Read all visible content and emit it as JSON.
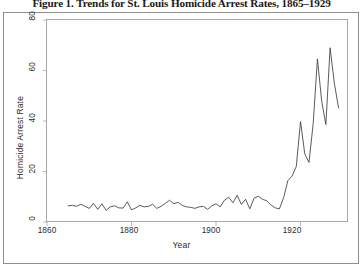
{
  "figure": {
    "title": "Figure 1. Trends for St. Louis Homicide Arrest Rates, 1865–1929"
  },
  "axes": {
    "y_label": "Homicide Arrest Rate",
    "x_label": "Year",
    "y_ticks": [
      "0",
      "20",
      "40",
      "60",
      "80"
    ],
    "x_ticks": [
      "1860",
      "1880",
      "1900",
      "1920"
    ]
  },
  "colors": {
    "line": "#3d3d3d",
    "axis": "#a8a8a8",
    "frame": "#8e8e8e",
    "text": "#2b2b2b",
    "background": "#ffffff"
  },
  "chart_data": {
    "type": "line",
    "title": "Figure 1. Trends for St. Louis Homicide Arrest Rates, 1865–1929",
    "xlabel": "Year",
    "ylabel": "Homicide Arrest Rate",
    "xlim": [
      1860,
      1931
    ],
    "ylim": [
      0,
      80
    ],
    "grid": false,
    "legend": "none",
    "yticks": [
      0,
      20,
      40,
      60,
      80
    ],
    "xticks": [
      1860,
      1880,
      1900,
      1920
    ],
    "series": [
      {
        "name": "Homicide Arrest Rate",
        "x": [
          1865,
          1866,
          1867,
          1868,
          1869,
          1870,
          1871,
          1872,
          1873,
          1874,
          1875,
          1876,
          1877,
          1878,
          1879,
          1880,
          1881,
          1882,
          1883,
          1884,
          1885,
          1886,
          1887,
          1888,
          1889,
          1890,
          1891,
          1892,
          1893,
          1894,
          1895,
          1896,
          1897,
          1898,
          1899,
          1900,
          1901,
          1902,
          1903,
          1904,
          1905,
          1906,
          1907,
          1908,
          1909,
          1910,
          1911,
          1912,
          1913,
          1914,
          1915,
          1916,
          1917,
          1918,
          1919,
          1920,
          1921,
          1922,
          1923,
          1924,
          1925,
          1926,
          1927,
          1928,
          1929
        ],
        "y": [
          6.4,
          6.6,
          6.2,
          7.0,
          6.2,
          5.4,
          7.4,
          5.0,
          7.2,
          4.6,
          6.0,
          6.4,
          5.6,
          5.5,
          8.0,
          4.8,
          5.6,
          6.6,
          6.0,
          6.2,
          7.0,
          5.4,
          6.2,
          7.4,
          8.6,
          7.2,
          7.8,
          6.6,
          6.0,
          5.8,
          5.4,
          6.0,
          6.2,
          5.0,
          6.4,
          7.2,
          6.0,
          8.6,
          9.8,
          7.6,
          10.6,
          7.0,
          9.0,
          5.2,
          9.4,
          10.2,
          9.0,
          8.4,
          6.8,
          5.6,
          5.2,
          9.6,
          16.4,
          18.2,
          22.0,
          39.8,
          27.0,
          23.6,
          39.0,
          64.6,
          48.0,
          38.6,
          69.0,
          55.0,
          45.2
        ]
      }
    ]
  }
}
